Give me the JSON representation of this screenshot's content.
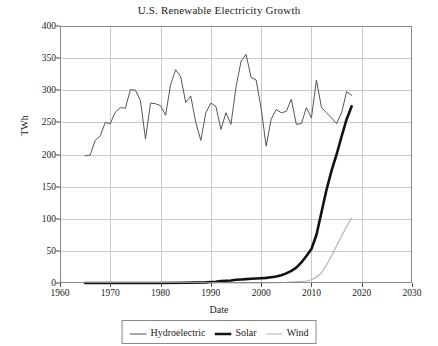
{
  "chart_data": {
    "type": "line",
    "title": "U.S. Renewable Electricity Growth",
    "xlabel": "Date",
    "ylabel": "TWh",
    "xlim": [
      1960,
      2030
    ],
    "ylim": [
      0,
      400
    ],
    "xticks": [
      1960,
      1970,
      1980,
      1990,
      2000,
      2010,
      2020,
      2030
    ],
    "yticks": [
      0,
      50,
      100,
      150,
      200,
      250,
      300,
      350,
      400
    ],
    "grid": true,
    "legend_position": "below-axis-center",
    "series": [
      {
        "name": "Hydroelectric",
        "color": "#555555",
        "width": 1,
        "x": [
          1965,
          1966,
          1967,
          1968,
          1969,
          1970,
          1971,
          1972,
          1973,
          1974,
          1975,
          1976,
          1977,
          1978,
          1979,
          1980,
          1981,
          1982,
          1983,
          1984,
          1985,
          1986,
          1987,
          1988,
          1989,
          1990,
          1991,
          1992,
          1993,
          1994,
          1995,
          1996,
          1997,
          1998,
          1999,
          2000,
          2001,
          2002,
          2003,
          2004,
          2005,
          2006,
          2007,
          2008,
          2009,
          2010,
          2011,
          2012,
          2013,
          2014,
          2015,
          2016,
          2017,
          2018
        ],
        "values": [
          198,
          199,
          222,
          229,
          250,
          248,
          266,
          273,
          272,
          301,
          300,
          284,
          224,
          280,
          279,
          276,
          261,
          309,
          332,
          321,
          281,
          291,
          250,
          222,
          265,
          280,
          275,
          239,
          265,
          247,
          305,
          345,
          356,
          320,
          316,
          272,
          213,
          255,
          270,
          265,
          267,
          286,
          247,
          248,
          273,
          257,
          316,
          273,
          265,
          257,
          248,
          265,
          298,
          292
        ]
      },
      {
        "name": "Solar",
        "color": "#111111",
        "width": 2.6,
        "x": [
          1965,
          1970,
          1975,
          1980,
          1985,
          1989,
          1990,
          1991,
          1992,
          1993,
          1994,
          1995,
          1996,
          1997,
          1998,
          1999,
          2000,
          2001,
          2002,
          2003,
          2004,
          2005,
          2006,
          2007,
          2008,
          2009,
          2010,
          2011,
          2012,
          2013,
          2014,
          2015,
          2016,
          2017,
          2018
        ],
        "values": [
          0,
          0,
          0,
          0,
          0.5,
          1,
          1.5,
          2,
          3,
          3.5,
          4,
          5,
          5.5,
          6,
          6.5,
          7,
          7.5,
          8,
          9,
          10,
          12,
          15,
          19,
          24,
          32,
          42,
          53,
          75,
          110,
          145,
          175,
          200,
          228,
          255,
          275
        ]
      },
      {
        "name": "Wind",
        "color": "#b0b0b0",
        "width": 1.1,
        "x": [
          1990,
          1995,
          2000,
          2003,
          2005,
          2007,
          2009,
          2010,
          2011,
          2012,
          2013,
          2014,
          2015,
          2016,
          2017,
          2018
        ],
        "values": [
          0,
          0,
          0.2,
          0.5,
          1,
          2,
          3,
          5,
          9,
          16,
          28,
          42,
          58,
          73,
          88,
          101
        ]
      }
    ]
  },
  "legend": {
    "items": [
      {
        "label": "Hydroelectric"
      },
      {
        "label": "Solar"
      },
      {
        "label": "Wind"
      }
    ]
  }
}
